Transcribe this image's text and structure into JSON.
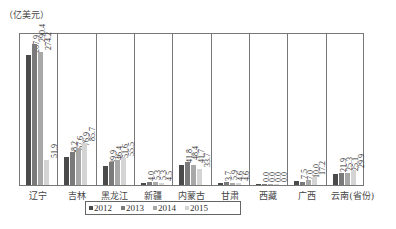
{
  "chart_data": {
    "type": "bar",
    "title": "",
    "unit_label": "（亿美元）",
    "xlabel": "",
    "ylabel": "亿美元",
    "ylim": [
      0,
      300
    ],
    "grid": false,
    "legend_position": "bottom",
    "categories": [
      "辽宁",
      "吉林",
      "黑龙江",
      "新疆",
      "内蒙古",
      "甘肃",
      "西藏",
      "广西",
      "云南(省份)"
    ],
    "series": [
      {
        "name": "2012",
        "color": "#4a4a4a",
        "values": [
          267.9,
          58.2,
          39.9,
          4.0,
          41.8,
          3.7,
          0.0,
          7.5,
          21.9
        ]
      },
      {
        "name": "2013",
        "color": "#7a7a7a",
        "values": [
          290.4,
          67.6,
          46.4,
          5.3,
          48.4,
          5.9,
          0.0,
          7.0,
          25.3
        ]
      },
      {
        "name": "2014",
        "color": "#a8a8a8",
        "values": [
          274.2,
          76.9,
          51.6,
          5.3,
          41.7,
          4.6,
          0.0,
          10.0,
          25.1
        ]
      },
      {
        "name": "2015",
        "color": "#d4d4d4",
        "values": [
          51.9,
          85.7,
          55.5,
          4.5,
          33.7,
          4.6,
          0.0,
          17.2,
          29.9
        ]
      }
    ],
    "value_labels": [
      [
        "267.9",
        "290.4",
        "274.2",
        "51.9"
      ],
      [
        "58.2",
        "67.6",
        "76.9",
        "85.7"
      ],
      [
        "39.9",
        "46.4",
        "51.6",
        "55.5"
      ],
      [
        "4.0",
        "5.3",
        "5.3",
        "4.5"
      ],
      [
        "41.8",
        "48.4",
        "41.7",
        "33.7"
      ],
      [
        "3.7",
        "5.9",
        "4.6",
        "4.6"
      ],
      [
        "0.0",
        "0.0",
        "0.0",
        "0.0"
      ],
      [
        "7.5",
        "7.0",
        "10.0",
        "17.2"
      ],
      [
        "21.9",
        "25.3",
        "25.1",
        "29.9"
      ]
    ]
  },
  "legend": {
    "items": [
      {
        "label": "2012",
        "icon": "square-swatch-dark"
      },
      {
        "label": "2013",
        "icon": "square-swatch-mid"
      },
      {
        "label": "2014",
        "icon": "square-swatch-light"
      },
      {
        "label": "2015",
        "icon": "square-swatch-lightest"
      }
    ]
  }
}
